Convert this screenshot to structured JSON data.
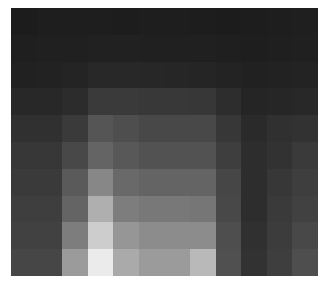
{
  "image": {
    "description": "pixelated grayscale mosaic",
    "rows": 10,
    "cols": 12,
    "gray_levels": [
      [
        28,
        30,
        30,
        30,
        29,
        30,
        30,
        29,
        28,
        29,
        30,
        31
      ],
      [
        31,
        32,
        32,
        33,
        33,
        32,
        32,
        32,
        31,
        30,
        31,
        32
      ],
      [
        33,
        34,
        36,
        40,
        40,
        39,
        38,
        37,
        35,
        33,
        34,
        35
      ],
      [
        40,
        40,
        44,
        58,
        58,
        56,
        56,
        55,
        45,
        37,
        38,
        40
      ],
      [
        48,
        48,
        58,
        85,
        78,
        72,
        72,
        72,
        55,
        42,
        48,
        50
      ],
      [
        55,
        55,
        72,
        100,
        88,
        82,
        82,
        82,
        62,
        45,
        50,
        58
      ],
      [
        58,
        58,
        90,
        135,
        105,
        100,
        100,
        100,
        70,
        45,
        55,
        62
      ],
      [
        62,
        62,
        100,
        175,
        125,
        120,
        120,
        118,
        72,
        45,
        58,
        65
      ],
      [
        65,
        65,
        125,
        205,
        150,
        140,
        140,
        140,
        78,
        48,
        60,
        72
      ],
      [
        70,
        70,
        155,
        235,
        170,
        155,
        155,
        185,
        80,
        50,
        62,
        78
      ]
    ]
  }
}
